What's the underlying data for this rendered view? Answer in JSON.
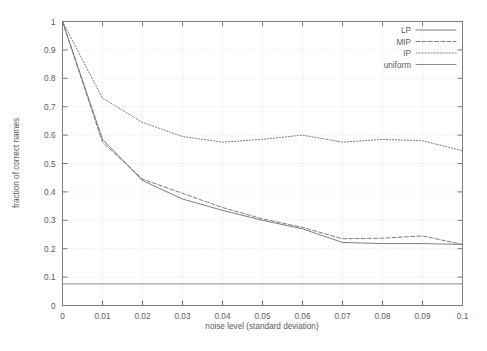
{
  "chart_data": {
    "type": "line",
    "title": "",
    "xlabel": "noise level (standard deviation)",
    "ylabel": "fraction of correct names",
    "xlim": [
      0,
      0.1
    ],
    "ylim": [
      0,
      1
    ],
    "grid": true,
    "legend_position": "top-right",
    "xticks": [
      "0",
      "0.01",
      "0.02",
      "0.03",
      "0.04",
      "0.05",
      "0.06",
      "0.07",
      "0.08",
      "0.09",
      "0.1"
    ],
    "xtick_values": [
      0,
      0.01,
      0.02,
      0.03,
      0.04,
      0.05,
      0.06,
      0.07,
      0.08,
      0.09,
      0.1
    ],
    "yticks": [
      "0",
      "0.1",
      "0.2",
      "0.3",
      "0.4",
      "0.5",
      "0.6",
      "0.7",
      "0.8",
      "0.9",
      "1"
    ],
    "ytick_values": [
      0,
      0.1,
      0.2,
      0.3,
      0.4,
      0.5,
      0.6,
      0.7,
      0.8,
      0.9,
      1.0
    ],
    "x": [
      0,
      0.01,
      0.02,
      0.03,
      0.04,
      0.05,
      0.06,
      0.07,
      0.08,
      0.09,
      0.1
    ],
    "series": [
      {
        "name": "LP",
        "style": "solid",
        "values": [
          1.0,
          0.585,
          0.44,
          0.375,
          0.335,
          0.3,
          0.27,
          0.222,
          0.218,
          0.218,
          0.215
        ]
      },
      {
        "name": "MIP",
        "style": "dashed",
        "values": [
          1.0,
          0.575,
          0.445,
          0.395,
          0.345,
          0.305,
          0.275,
          0.235,
          0.237,
          0.245,
          0.215
        ]
      },
      {
        "name": "IP",
        "style": "dotted",
        "values": [
          1.0,
          0.73,
          0.645,
          0.595,
          0.575,
          0.585,
          0.6,
          0.575,
          0.585,
          0.58,
          0.545
        ]
      },
      {
        "name": "uniform",
        "style": "solid-thin",
        "values": [
          0.076,
          0.076,
          0.076,
          0.076,
          0.076,
          0.076,
          0.076,
          0.076,
          0.076,
          0.076,
          0.076
        ]
      }
    ]
  },
  "legend": {
    "entries": [
      {
        "label": "LP"
      },
      {
        "label": "MIP"
      },
      {
        "label": "IP"
      },
      {
        "label": "uniform"
      }
    ]
  },
  "colors": {
    "line": "#6e6e6e",
    "frame": "#808080",
    "grid": "#cfcfcf",
    "text": "#5a5a5a",
    "background": "#ffffff"
  }
}
